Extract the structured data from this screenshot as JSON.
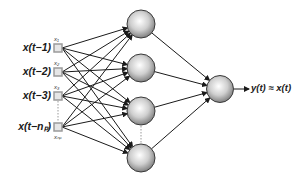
{
  "diagram": {
    "title": "",
    "type": "feedforward-neural-network",
    "inputs": [
      {
        "label": "x(t−1)",
        "sub": "x₁",
        "y": 48
      },
      {
        "label": "x(t−2)",
        "sub": "x₂",
        "y": 72
      },
      {
        "label": "x(t−3)",
        "sub": "x₃",
        "y": 96
      },
      {
        "label": "x(t−nₚ)",
        "sub": "xₙₚ",
        "y": 127
      }
    ],
    "hidden_nodes": [
      {
        "id": "h1",
        "cx": 141,
        "cy": 24
      },
      {
        "id": "h2",
        "cx": 141,
        "cy": 68
      },
      {
        "id": "h3",
        "cx": 141,
        "cy": 111
      },
      {
        "id": "h4",
        "cx": 141,
        "cy": 158
      }
    ],
    "output_node": {
      "cx": 220,
      "cy": 89
    },
    "output_label": "y(t) ≈ x(t)",
    "colors": {
      "node_fill_center": "#ffffff",
      "node_fill_edge": "#8a8a8a",
      "node_stroke": "#3a3a3a",
      "edge": "#1a1a1a",
      "input_square": "#9a9a9a",
      "dotted": "#999999"
    }
  }
}
